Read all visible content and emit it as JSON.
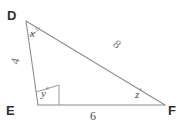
{
  "figure": {
    "kind": "geometry-triangle-diagram",
    "background_color": "#ffffff",
    "stroke_color": "#8c8c8c",
    "text_color": "#3a3a3a"
  },
  "vertices": [
    {
      "name": "D",
      "label": "D",
      "x": 26,
      "y": 21
    },
    {
      "name": "E",
      "label": "E",
      "x": 38,
      "y": 105
    },
    {
      "name": "F",
      "label": "F",
      "x": 165,
      "y": 105
    }
  ],
  "angles": [
    {
      "at": "D",
      "label": "x",
      "degree_symbol": "°"
    },
    {
      "at": "E",
      "label": "y",
      "degree_symbol": "°"
    },
    {
      "at": "F",
      "label": "z",
      "degree_symbol": "°"
    }
  ],
  "sides": [
    {
      "name": "DE",
      "label": "4",
      "rotated": true
    },
    {
      "name": "DF",
      "label": "8",
      "rotated": true
    },
    {
      "name": "EF",
      "label": "6",
      "rotated": false
    }
  ],
  "markers": {
    "angle_e_marker": "quadrilateral-angle-marker",
    "angle_d_marker": "angle-arc"
  }
}
